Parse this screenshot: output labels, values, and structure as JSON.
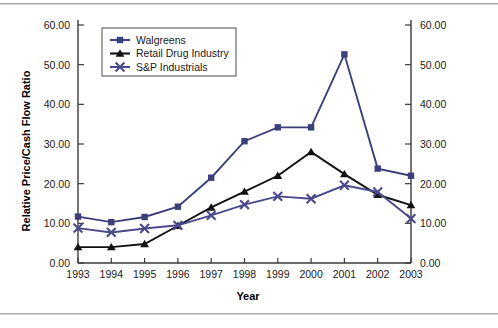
{
  "figure": {
    "background": "#ffffff",
    "rule_color": "#9a9a9a"
  },
  "chart_data": {
    "type": "line",
    "title": "",
    "xlabel": "Year",
    "ylabel": "Relative Price/Cash Flow Ratio",
    "categories": [
      "1993",
      "1994",
      "1995",
      "1996",
      "1997",
      "1998",
      "1999",
      "2000",
      "2001",
      "2002",
      "2003"
    ],
    "x": [
      1993,
      1994,
      1995,
      1996,
      1997,
      1998,
      1999,
      2000,
      2001,
      2002,
      2003
    ],
    "ylim": [
      0,
      60
    ],
    "yticks": [
      0,
      10,
      20,
      30,
      40,
      50,
      60
    ],
    "ytick_labels": [
      "0.00",
      "10.00",
      "20.00",
      "30.00",
      "40.00",
      "50.00",
      "60.00"
    ],
    "right_axis": true,
    "right_ylim": [
      0,
      60
    ],
    "right_ytick_labels": [
      "0.00",
      "10.00",
      "20.00",
      "30.00",
      "40.00",
      "50.00",
      "60.00"
    ],
    "grid": false,
    "legend_position": "upper-left-inside",
    "series": [
      {
        "name": "Walgreens",
        "color": "#3b3f7a",
        "marker": "square",
        "values": [
          11.7,
          10.3,
          11.6,
          14.2,
          21.5,
          30.7,
          34.2,
          34.2,
          52.6,
          23.8,
          22.0
        ]
      },
      {
        "name": "Retail Drug Industry",
        "color": "#121212",
        "marker": "triangle",
        "values": [
          4.0,
          4.0,
          4.8,
          9.4,
          14.0,
          18.0,
          22.0,
          28.0,
          22.4,
          17.2,
          14.6
        ]
      },
      {
        "name": "S&P Industrials",
        "color": "#4a4a8c",
        "marker": "x",
        "values": [
          8.8,
          7.7,
          8.7,
          9.5,
          12.0,
          14.7,
          16.8,
          16.2,
          19.6,
          17.9,
          11.2
        ]
      }
    ]
  }
}
